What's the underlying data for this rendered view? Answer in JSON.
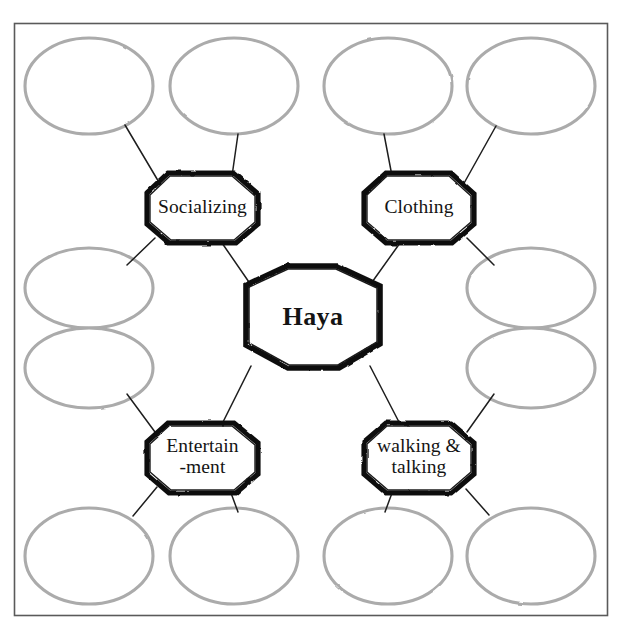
{
  "page": {
    "style": "hand-drawn concept map",
    "frame_color": "#4a4a4a",
    "node_stroke_color": "#111111",
    "bubble_stroke_color": "#a9a9a9",
    "connector_color": "#222222",
    "background": "#ffffff"
  },
  "center_node": {
    "label": "Haya",
    "shape": "octagon"
  },
  "branches": [
    {
      "id": "socializing",
      "label": "Socializing",
      "shape": "octagon",
      "position": "top-left"
    },
    {
      "id": "clothing",
      "label": "Clothing",
      "shape": "octagon",
      "position": "top-right"
    },
    {
      "id": "entertainment",
      "label": "Entertain\n-ment",
      "shape": "octagon",
      "position": "bottom-left"
    },
    {
      "id": "walking-talking",
      "label": "walking &\ntalking",
      "shape": "octagon",
      "position": "bottom-right"
    }
  ],
  "blank_bubbles": [
    {
      "id": "bubble-1",
      "label": "",
      "row": "top",
      "column": 1
    },
    {
      "id": "bubble-2",
      "label": "",
      "row": "top",
      "column": 2
    },
    {
      "id": "bubble-3",
      "label": "",
      "row": "top",
      "column": 3
    },
    {
      "id": "bubble-4",
      "label": "",
      "row": "top",
      "column": 4
    },
    {
      "id": "bubble-5",
      "label": "",
      "row": "middle-upper",
      "column": 1
    },
    {
      "id": "bubble-6",
      "label": "",
      "row": "middle-upper",
      "column": 4
    },
    {
      "id": "bubble-7",
      "label": "",
      "row": "middle-lower",
      "column": 1
    },
    {
      "id": "bubble-8",
      "label": "",
      "row": "middle-lower",
      "column": 4
    },
    {
      "id": "bubble-9",
      "label": "",
      "row": "bottom",
      "column": 1
    },
    {
      "id": "bubble-10",
      "label": "",
      "row": "bottom",
      "column": 2
    },
    {
      "id": "bubble-11",
      "label": "",
      "row": "bottom",
      "column": 3
    },
    {
      "id": "bubble-12",
      "label": "",
      "row": "bottom",
      "column": 4
    }
  ],
  "connectors": [
    {
      "from": "center",
      "to": "socializing"
    },
    {
      "from": "center",
      "to": "clothing"
    },
    {
      "from": "center",
      "to": "entertainment"
    },
    {
      "from": "center",
      "to": "walking-talking"
    },
    {
      "from": "socializing",
      "to": "bubble-1"
    },
    {
      "from": "socializing",
      "to": "bubble-2"
    },
    {
      "from": "socializing",
      "to": "bubble-5"
    },
    {
      "from": "clothing",
      "to": "bubble-3"
    },
    {
      "from": "clothing",
      "to": "bubble-4"
    },
    {
      "from": "clothing",
      "to": "bubble-6"
    },
    {
      "from": "entertainment",
      "to": "bubble-7"
    },
    {
      "from": "entertainment",
      "to": "bubble-9"
    },
    {
      "from": "entertainment",
      "to": "bubble-10"
    },
    {
      "from": "walking-talking",
      "to": "bubble-8"
    },
    {
      "from": "walking-talking",
      "to": "bubble-11"
    },
    {
      "from": "walking-talking",
      "to": "bubble-12"
    }
  ]
}
